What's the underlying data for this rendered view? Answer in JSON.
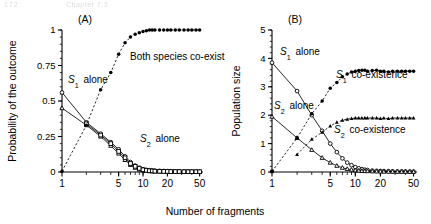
{
  "header": {
    "page_number": "172",
    "running_head": "Chapter 7.3"
  },
  "figure": {
    "xlabel": "Number of fragments",
    "panels": [
      {
        "tag": "(A)",
        "ylabel": "Probability of the outcome",
        "yticks": [
          "0",
          "0.25",
          "0.5",
          "0.75",
          "1"
        ],
        "xticks": [
          "1",
          "5",
          "10",
          "20",
          "50"
        ],
        "annotations": [
          {
            "id": "s1-alone",
            "text": "S₁ alone"
          },
          {
            "id": "s2-alone",
            "text": "S₂ alone"
          },
          {
            "id": "coexist",
            "text": "Both species co-exist"
          }
        ]
      },
      {
        "tag": "(B)",
        "ylabel": "Population size",
        "yticks": [
          "0",
          "1",
          "2",
          "3",
          "4",
          "5"
        ],
        "xticks": [
          "1",
          "5",
          "10",
          "20",
          "50"
        ],
        "annotations": [
          {
            "id": "s1-alone",
            "text": "S₁ alone"
          },
          {
            "id": "s2-alone",
            "text": "S₂ alone"
          },
          {
            "id": "s1-coex",
            "text": "S₁ co-existence"
          },
          {
            "id": "s2-coex",
            "text": "S₂ co-existence"
          }
        ]
      }
    ]
  },
  "chart_data": [
    {
      "type": "line",
      "panel": "A",
      "title": "(A)",
      "xlabel": "Number of fragments",
      "ylabel": "Probability of the outcome",
      "xscale": "log",
      "xlim": [
        1,
        55
      ],
      "ylim": [
        0,
        1
      ],
      "xticks": [
        1,
        5,
        10,
        20,
        50
      ],
      "yticks": [
        0,
        0.25,
        0.5,
        0.75,
        1
      ],
      "grid": false,
      "legend": "inline-annotations",
      "series": [
        {
          "name": "S1 alone",
          "marker": "open-circle",
          "line": "solid",
          "x": [
            1,
            2,
            3,
            4,
            5,
            6,
            7,
            8,
            9,
            10,
            11,
            12,
            13,
            14,
            16,
            18,
            20,
            22,
            25,
            28,
            32,
            36,
            40,
            45,
            50
          ],
          "values": [
            0.56,
            0.35,
            0.27,
            0.21,
            0.16,
            0.11,
            0.07,
            0.045,
            0.03,
            0.02,
            0.015,
            0.012,
            0.01,
            0.009,
            0.008,
            0.007,
            0.006,
            0.006,
            0.005,
            0.005,
            0.004,
            0.004,
            0.004,
            0.003,
            0.003
          ]
        },
        {
          "name": "S2 alone",
          "marker": "open-triangle",
          "line": "solid",
          "x": [
            1,
            2,
            3,
            4,
            5,
            6,
            7,
            8,
            9,
            10,
            11,
            12,
            13,
            14,
            16,
            18,
            20,
            22,
            25,
            28,
            32,
            36,
            40,
            45,
            50
          ],
          "values": [
            0.45,
            0.33,
            0.25,
            0.185,
            0.13,
            0.085,
            0.05,
            0.03,
            0.018,
            0.012,
            0.008,
            0.006,
            0.005,
            0.004,
            0.003,
            0.003,
            0.002,
            0.002,
            0.002,
            0.002,
            0.001,
            0.001,
            0.001,
            0.001,
            0.001
          ]
        },
        {
          "name": "S2 alone (squares)",
          "marker": "open-square",
          "line": "solid",
          "x": [
            2,
            3,
            4,
            5,
            6,
            7,
            8,
            9,
            10,
            11,
            12,
            13,
            14,
            16,
            18,
            20,
            22,
            25,
            28,
            32,
            36,
            40,
            45,
            50
          ],
          "values": [
            0.34,
            0.26,
            0.2,
            0.145,
            0.1,
            0.06,
            0.04,
            0.025,
            0.016,
            0.012,
            0.009,
            0.008,
            0.006,
            0.005,
            0.004,
            0.004,
            0.003,
            0.003,
            0.003,
            0.002,
            0.002,
            0.002,
            0.002,
            0.002
          ]
        },
        {
          "name": "Both species co-exist",
          "marker": "filled-circle",
          "line": "dashed",
          "x": [
            1,
            2,
            3,
            4,
            5,
            6,
            7,
            8,
            9,
            10,
            11,
            12,
            13,
            14,
            16,
            18,
            20,
            22,
            25,
            28,
            32,
            36,
            40,
            45,
            50
          ],
          "values": [
            0.005,
            0.33,
            0.58,
            0.7,
            0.83,
            0.91,
            0.95,
            0.97,
            0.98,
            0.99,
            0.995,
            1.0,
            1.0,
            1.0,
            1.0,
            1.0,
            1.0,
            1.0,
            1.0,
            1.0,
            1.0,
            1.0,
            1.0,
            1.0,
            1.0
          ]
        }
      ]
    },
    {
      "type": "line",
      "panel": "B",
      "title": "(B)",
      "xlabel": "Number of fragments",
      "ylabel": "Population size",
      "xscale": "log",
      "xlim": [
        1,
        55
      ],
      "ylim": [
        0,
        5
      ],
      "xticks": [
        1,
        5,
        10,
        20,
        50
      ],
      "yticks": [
        0,
        1,
        2,
        3,
        4,
        5
      ],
      "grid": false,
      "legend": "inline-annotations",
      "series": [
        {
          "name": "S1 alone",
          "marker": "open-circle",
          "line": "solid",
          "x": [
            1,
            2,
            3,
            4,
            5,
            6,
            7,
            8,
            9,
            10,
            11,
            12,
            13,
            14,
            16,
            18,
            20,
            22,
            25,
            28,
            32,
            36,
            40,
            45,
            50
          ],
          "values": [
            3.85,
            2.85,
            2.0,
            1.45,
            1.0,
            0.7,
            0.48,
            0.33,
            0.24,
            0.17,
            0.13,
            0.1,
            0.08,
            0.07,
            0.05,
            0.04,
            0.035,
            0.03,
            0.03,
            0.025,
            0.02,
            0.02,
            0.02,
            0.015,
            0.015
          ]
        },
        {
          "name": "S2 alone",
          "marker": "open-triangle",
          "line": "solid",
          "x": [
            1,
            2,
            3,
            4,
            5,
            6,
            7,
            8,
            9,
            10,
            11,
            12,
            13,
            14,
            16,
            18,
            20,
            22,
            25,
            28,
            32,
            36,
            40,
            45,
            50
          ],
          "values": [
            1.95,
            1.2,
            0.78,
            0.5,
            0.33,
            0.22,
            0.15,
            0.11,
            0.08,
            0.06,
            0.05,
            0.04,
            0.035,
            0.03,
            0.025,
            0.02,
            0.018,
            0.015,
            0.013,
            0.012,
            0.01,
            0.01,
            0.01,
            0.008,
            0.008
          ]
        },
        {
          "name": "S1 co-existence",
          "marker": "filled-circle",
          "line": "dashed",
          "x": [
            1,
            2,
            3,
            4,
            5,
            6,
            7,
            8,
            9,
            10,
            11,
            12,
            13,
            14,
            16,
            18,
            20,
            22,
            25,
            28,
            32,
            36,
            40,
            45,
            50
          ],
          "values": [
            0.02,
            1.2,
            2.05,
            2.5,
            2.95,
            3.15,
            3.35,
            3.45,
            3.52,
            3.55,
            3.57,
            3.58,
            3.58,
            3.55,
            3.57,
            3.58,
            3.55,
            3.55,
            3.52,
            3.55,
            3.55,
            3.55,
            3.55,
            3.55,
            3.55
          ]
        },
        {
          "name": "S2 co-existence",
          "marker": "filled-triangle",
          "line": "dashed",
          "x": [
            2,
            3,
            4,
            5,
            6,
            7,
            8,
            9,
            10,
            11,
            12,
            13,
            14,
            16,
            18,
            20,
            22,
            25,
            28,
            32,
            36,
            40,
            45,
            50
          ],
          "values": [
            0.62,
            1.15,
            1.4,
            1.62,
            1.75,
            1.82,
            1.86,
            1.88,
            1.9,
            1.9,
            1.9,
            1.9,
            1.9,
            1.9,
            1.9,
            1.88,
            1.9,
            1.88,
            1.9,
            1.9,
            1.9,
            1.9,
            1.9,
            1.9
          ]
        },
        {
          "name": "Extinction (filled square)",
          "marker": "filled-square",
          "line": "none",
          "x": [
            1
          ],
          "values": [
            0.02
          ]
        }
      ]
    }
  ]
}
